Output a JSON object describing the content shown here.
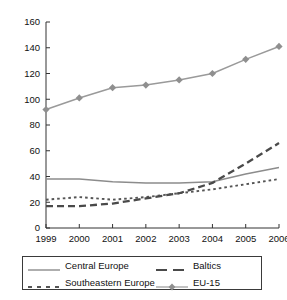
{
  "chart_data": {
    "type": "line",
    "title": "",
    "xlabel": "",
    "ylabel": "",
    "categories": [
      "1999",
      "2000",
      "2001",
      "2002",
      "2003",
      "2004",
      "2005",
      "2006"
    ],
    "x": [
      1999,
      2000,
      2001,
      2002,
      2003,
      2004,
      2005,
      2006
    ],
    "ylim": [
      0,
      160
    ],
    "xlim": [
      1999,
      2006
    ],
    "yticks": [
      0,
      20,
      40,
      60,
      80,
      100,
      120,
      140,
      160
    ],
    "grid": false,
    "legend_position": "bottom",
    "series": [
      {
        "name": "Central Europe",
        "style": "solid",
        "color": "#8c8c8c",
        "marker": "none",
        "values": [
          38,
          38,
          36,
          35,
          35,
          36,
          42,
          47
        ]
      },
      {
        "name": "Southeastern Europe",
        "style": "dotted",
        "color": "#555555",
        "marker": "none",
        "values": [
          22,
          24,
          22,
          24,
          27,
          30,
          34,
          38
        ]
      },
      {
        "name": "Baltics",
        "style": "dashed",
        "color": "#4a4a4a",
        "marker": "none",
        "values": [
          17,
          17,
          19,
          23,
          27,
          35,
          50,
          66
        ]
      },
      {
        "name": "EU-15",
        "style": "solid",
        "color": "#9a9a9a",
        "marker": "diamond",
        "values": [
          92,
          101,
          109,
          111,
          115,
          120,
          131,
          141
        ]
      }
    ]
  },
  "axis": {
    "y_tick_labels": [
      "160",
      "140",
      "120",
      "100",
      "80",
      "60",
      "40",
      "20",
      "0"
    ],
    "x_tick_labels": [
      "1999",
      "2000",
      "2001",
      "2002",
      "2003",
      "2004",
      "2005",
      "2006"
    ]
  },
  "legend": {
    "entries": [
      {
        "label": "Central Europe",
        "style": "solid",
        "color": "#8c8c8c",
        "marker": "none"
      },
      {
        "label": "Baltics",
        "style": "dashed",
        "color": "#4a4a4a",
        "marker": "none"
      },
      {
        "label": "Southeastern Europe",
        "style": "dotted",
        "color": "#555555",
        "marker": "none"
      },
      {
        "label": "EU-15",
        "style": "solid",
        "color": "#9a9a9a",
        "marker": "diamond"
      }
    ]
  },
  "colors": {
    "axis": "#333333",
    "legend_border": "#3a3a3a",
    "background": "#ffffff",
    "text": "#111111"
  }
}
